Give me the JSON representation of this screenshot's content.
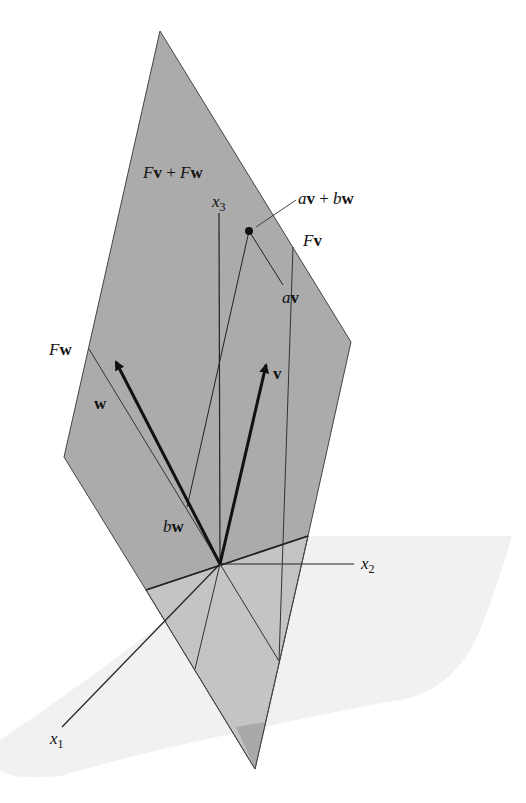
{
  "diagram": {
    "colors": {
      "upper_plane": "#ababab",
      "lower_plane": "#c4c4c4",
      "bottom_tip": "#a9a9a9",
      "horizontal_plane": "#f1f1f1",
      "line": "#222222",
      "background": "#ffffff"
    },
    "labels": {
      "span": {
        "a": "F",
        "b": "v",
        "c": " + ",
        "d": "F",
        "e": "w"
      },
      "combo": {
        "a": "a",
        "b": "v",
        "c": " + ",
        "d": "b",
        "e": "w"
      },
      "fv": {
        "a": "F",
        "b": "v"
      },
      "fw": {
        "a": "F",
        "b": "w"
      },
      "av": {
        "a": "a",
        "b": "v"
      },
      "bw": {
        "a": "b",
        "b": "w"
      },
      "v": "v",
      "w": "w",
      "x1": {
        "base": "x",
        "sub": "1"
      },
      "x2": {
        "base": "x",
        "sub": "2"
      },
      "x3": {
        "base": "x",
        "sub": "3"
      }
    },
    "points": {
      "origin": [
        220,
        564
      ],
      "top_vertex": [
        160,
        31
      ],
      "right_vertex": [
        351,
        342
      ],
      "left_vertex": [
        64,
        457
      ],
      "bottom_vertex": [
        255,
        769
      ],
      "combo_point": [
        249,
        231
      ],
      "av_point": [
        283,
        285
      ],
      "bw_point": [
        187,
        507
      ],
      "v_tip": [
        266,
        365
      ],
      "w_tip": [
        116,
        362
      ]
    }
  }
}
